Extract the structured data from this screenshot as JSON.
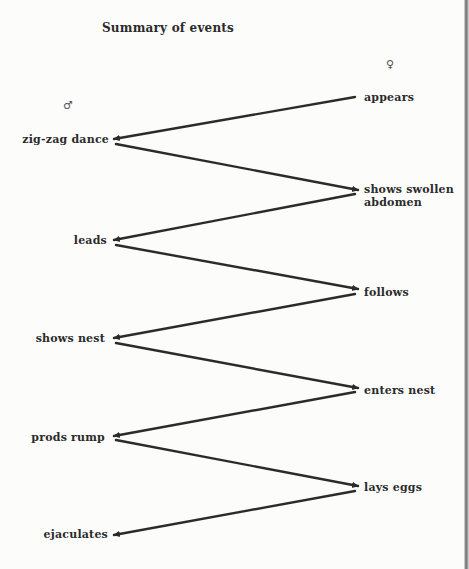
{
  "diagram": {
    "title": "Summary of events",
    "male": {
      "symbol": "♂",
      "icon": "male-symbol-icon"
    },
    "female": {
      "symbol": "♀",
      "icon": "female-symbol-icon"
    },
    "male_events": [
      {
        "label": "zig-zag dance"
      },
      {
        "label": "leads"
      },
      {
        "label": "shows nest"
      },
      {
        "label": "prods rump"
      },
      {
        "label": "ejaculates"
      }
    ],
    "female_events": [
      {
        "label": "appears",
        "line2": ""
      },
      {
        "label": "shows swollen",
        "line2": "abdomen"
      },
      {
        "label": "follows",
        "line2": ""
      },
      {
        "label": "enters nest",
        "line2": ""
      },
      {
        "label": "lays eggs",
        "line2": ""
      }
    ],
    "sequence": [
      "female:appears",
      "male:zig-zag dance",
      "female:shows swollen abdomen",
      "male:leads",
      "female:follows",
      "male:shows nest",
      "female:enters nest",
      "male:prods rump",
      "female:lays eggs",
      "male:ejaculates"
    ],
    "colors": {
      "ink": "#2b2b2b",
      "background": "#fcfcfb"
    }
  }
}
